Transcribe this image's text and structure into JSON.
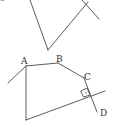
{
  "diagram": {
    "type": "geometry",
    "colors": {
      "stroke": "#4a4a4a",
      "label": "#333333",
      "background": "#ffffff"
    },
    "top_figure": {
      "segments": [
        {
          "from": [
            30,
            0
          ],
          "to": [
            48,
            50
          ]
        },
        {
          "from": [
            48,
            50
          ],
          "to": [
            88,
            2
          ]
        },
        {
          "from": [
            82,
            0
          ],
          "to": [
            99,
            19
          ]
        }
      ]
    },
    "bottom_figure": {
      "labels": {
        "A": "A",
        "B": "B",
        "C": "C",
        "D": "D"
      },
      "right_angle_marker": true
    }
  }
}
